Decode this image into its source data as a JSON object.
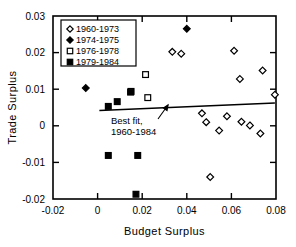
{
  "chart_data": {
    "type": "scatter",
    "title": "",
    "xlabel": "Budget Surplus",
    "ylabel": "Trade Surplus",
    "xlim": [
      -0.02,
      0.08
    ],
    "ylim": [
      -0.02,
      0.03
    ],
    "xticks": [
      "-0.02",
      "0",
      "0.02",
      "0.04",
      "0.06",
      "0.08"
    ],
    "xtick_values": [
      -0.02,
      0,
      0.02,
      0.04,
      0.06,
      0.08
    ],
    "yticks": [
      "0.03",
      "0.02",
      "0.01",
      "0",
      "-0.01",
      "-0.02"
    ],
    "ytick_values": [
      0.03,
      0.02,
      0.01,
      0,
      -0.01,
      -0.02
    ],
    "grid": false,
    "legend_position": "upper-left",
    "legend": [
      {
        "label": "1960-1973",
        "marker": "open-diamond"
      },
      {
        "label": "1974-1975",
        "marker": "filled-diamond"
      },
      {
        "label": "1976-1978",
        "marker": "open-square"
      },
      {
        "label": "1979-1984",
        "marker": "filled-square"
      }
    ],
    "annotations": [
      {
        "text_line1": "Best fit,",
        "text_line2": "1960-1984",
        "x": 0.006,
        "y": 0.0005
      }
    ],
    "series": [
      {
        "name": "1960-1973",
        "marker": "open-diamond",
        "points": [
          {
            "x": 0.0335,
            "y": 0.0202
          },
          {
            "x": 0.0375,
            "y": 0.0197
          },
          {
            "x": 0.0612,
            "y": 0.0205
          },
          {
            "x": 0.0638,
            "y": 0.0128
          },
          {
            "x": 0.074,
            "y": 0.0151
          },
          {
            "x": 0.0795,
            "y": 0.0085
          },
          {
            "x": 0.0468,
            "y": 0.0034
          },
          {
            "x": 0.0487,
            "y": 0.001
          },
          {
            "x": 0.0545,
            "y": -0.0013
          },
          {
            "x": 0.058,
            "y": 0.0026
          },
          {
            "x": 0.0645,
            "y": 0.0011
          },
          {
            "x": 0.0683,
            "y": 0.0001
          },
          {
            "x": 0.073,
            "y": -0.0021
          },
          {
            "x": 0.0505,
            "y": -0.014
          }
        ]
      },
      {
        "name": "1974-1975",
        "marker": "filled-diamond",
        "points": [
          {
            "x": -0.0053,
            "y": 0.0103
          },
          {
            "x": 0.04,
            "y": 0.0265
          }
        ]
      },
      {
        "name": "1976-1978",
        "marker": "open-square",
        "points": [
          {
            "x": 0.0215,
            "y": 0.014
          },
          {
            "x": 0.0225,
            "y": 0.0077
          },
          {
            "x": 0.015,
            "y": 0.0094
          }
        ]
      },
      {
        "name": "1979-1984",
        "marker": "filled-square",
        "points": [
          {
            "x": 0.0048,
            "y": 0.0053
          },
          {
            "x": 0.0088,
            "y": 0.0066
          },
          {
            "x": 0.0148,
            "y": 0.0092
          },
          {
            "x": 0.0048,
            "y": -0.0081
          },
          {
            "x": 0.018,
            "y": -0.0081
          },
          {
            "x": 0.0172,
            "y": -0.0187
          }
        ]
      }
    ],
    "fit_line": {
      "name": "Best fit, 1960-1984",
      "x_start": 0.0008,
      "y_start": 0.0042,
      "x_end": 0.0795,
      "y_end": 0.0062
    }
  }
}
